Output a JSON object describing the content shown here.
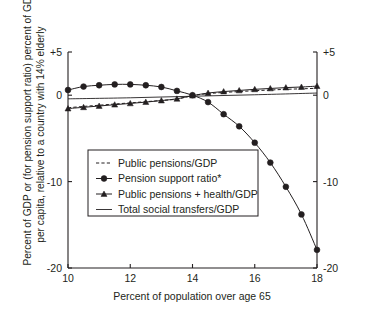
{
  "chart_data": {
    "type": "line",
    "title": "",
    "xlabel": "Percent of population over age 65",
    "ylabel_line1": "Percent of GDP or (for pension support ratio) percent of GDP",
    "ylabel_line2": "per capita, relative to a country with 14% elderly",
    "xlim": [
      10,
      18
    ],
    "ylim": [
      -20,
      5
    ],
    "xticks": [
      10,
      12,
      14,
      16,
      18
    ],
    "xtick_labels": [
      "10",
      "12",
      "14",
      "16",
      "18"
    ],
    "yticks": [
      5,
      0,
      -10,
      -20
    ],
    "ytick_labels": [
      "+5",
      "0",
      "-10",
      "-20"
    ],
    "right_axis": true,
    "right_ytick_labels": [
      "+5",
      "0",
      "-10",
      "-20"
    ],
    "grid": false,
    "legend_position": "center-left",
    "footnote_marker": "*",
    "series": [
      {
        "name": "Public pensions/GDP",
        "style": "dashed",
        "marker": "none",
        "x": [
          10,
          10.5,
          11,
          11.5,
          12,
          12.5,
          13,
          13.5,
          14,
          14.5,
          15,
          15.5,
          16,
          16.5,
          17,
          17.5,
          18
        ],
        "values": [
          -1.45,
          -1.3,
          -1.16,
          -1.02,
          -0.89,
          -0.75,
          -0.61,
          -0.45,
          -0.05,
          0.18,
          0.32,
          0.42,
          0.52,
          0.6,
          0.68,
          0.74,
          0.8
        ]
      },
      {
        "name": "Pension support ratio*",
        "style": "solid",
        "marker": "circle",
        "x": [
          10,
          10.5,
          11,
          11.5,
          12,
          12.5,
          13,
          13.5,
          14,
          14.5,
          15,
          15.5,
          16,
          16.5,
          17,
          17.5,
          18
        ],
        "values": [
          0.6,
          1.0,
          1.15,
          1.25,
          1.25,
          1.15,
          0.95,
          0.5,
          0.0,
          -0.8,
          -2.2,
          -3.6,
          -5.5,
          -7.8,
          -10.6,
          -13.8,
          -17.9
        ]
      },
      {
        "name": "Public pensions + health/GDP",
        "style": "solid",
        "marker": "triangle",
        "x": [
          10,
          10.5,
          11,
          11.5,
          12,
          12.5,
          13,
          13.5,
          14,
          14.5,
          15,
          15.5,
          16,
          16.5,
          17,
          17.5,
          18
        ],
        "values": [
          -1.55,
          -1.4,
          -1.25,
          -1.1,
          -0.95,
          -0.8,
          -0.62,
          -0.42,
          -0.05,
          0.25,
          0.42,
          0.55,
          0.68,
          0.78,
          0.88,
          0.95,
          1.05
        ]
      },
      {
        "name": "Total social transfers/GDP",
        "style": "solid-thin",
        "marker": "none",
        "x": [
          10,
          12,
          14,
          16,
          18
        ],
        "values": [
          -0.42,
          -0.3,
          -0.12,
          0.05,
          0.25
        ]
      }
    ],
    "legend_entries": [
      {
        "label": "Public pensions/GDP",
        "sample": "dashed"
      },
      {
        "label": "Pension support ratio*",
        "sample": "line-circle"
      },
      {
        "label": "Public pensions + health/GDP",
        "sample": "line-triangle"
      },
      {
        "label": "Total social transfers/GDP",
        "sample": "solid"
      }
    ],
    "colors": {
      "ink": "#231f20",
      "background": "#ffffff"
    }
  }
}
